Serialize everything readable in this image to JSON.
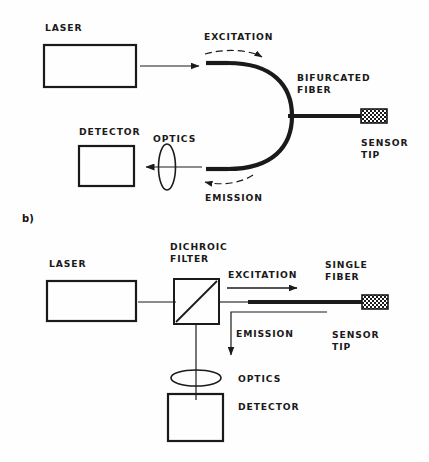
{
  "figure": {
    "background_color": "#fefefe",
    "ink_color": "#1a1a1a",
    "panels": [
      {
        "tag": "",
        "name": "panel-a-bifurcated-fiber",
        "labels": {
          "laser": "LASER",
          "excitation": "EXCITATION",
          "bifurcated_fiber_line1": "BIFURCATED",
          "bifurcated_fiber_line2": "FIBER",
          "sensor_tip_line1": "SENSOR",
          "sensor_tip_line2": "TIP",
          "detector": "DETECTOR",
          "optics": "OPTICS",
          "emission": "EMISSION"
        }
      },
      {
        "tag": "b)",
        "name": "panel-b-single-fiber",
        "labels": {
          "laser": "LASER",
          "dichroic_filter_line1": "DICHROIC",
          "dichroic_filter_line2": "FILTER",
          "excitation": "EXCITATION",
          "single_fiber_line1": "SINGLE",
          "single_fiber_line2": "FIBER",
          "sensor_tip_line1": "SENSOR",
          "sensor_tip_line2": "TIP",
          "emission": "EMISSION",
          "optics": "OPTICS",
          "detector": "DETECTOR"
        }
      }
    ]
  }
}
